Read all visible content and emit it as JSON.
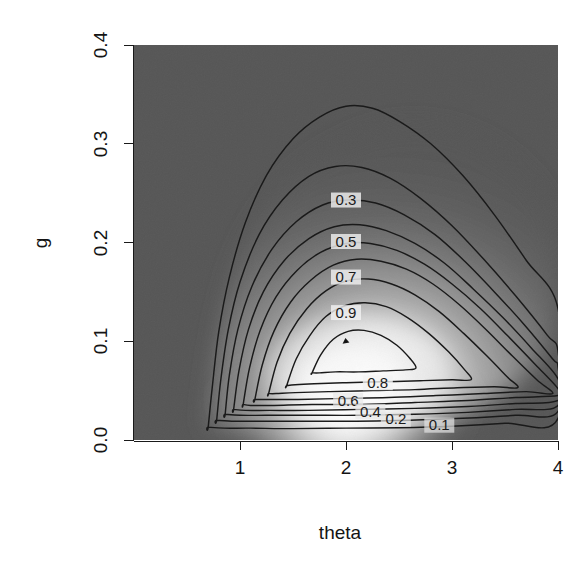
{
  "figure": {
    "kind": "contour-plot-with-grayscale-image",
    "background_color": "#ffffff",
    "panel_fill_color": "#565656",
    "contour_color": "#1a1a1a",
    "axis_color": "#141414"
  },
  "axes": {
    "x": {
      "title": "theta",
      "ticks": [
        {
          "label": "1",
          "value": 1
        },
        {
          "label": "2",
          "value": 2
        },
        {
          "label": "3",
          "value": 3
        },
        {
          "label": "4",
          "value": 4
        }
      ],
      "range": [
        0.0,
        4.0
      ]
    },
    "y": {
      "title": "g",
      "ticks": [
        {
          "label": "0.0",
          "value": 0.0
        },
        {
          "label": "0.1",
          "value": 0.1
        },
        {
          "label": "0.2",
          "value": 0.2
        },
        {
          "label": "0.3",
          "value": 0.3
        },
        {
          "label": "0.4",
          "value": 0.4
        }
      ],
      "range": [
        0.0,
        0.4
      ]
    }
  },
  "contour_labels": [
    {
      "text": "0.3",
      "x": 2.0,
      "y": 0.243
    },
    {
      "text": "0.5",
      "x": 2.0,
      "y": 0.201
    },
    {
      "text": "0.7",
      "x": 2.0,
      "y": 0.165
    },
    {
      "text": "0.9",
      "x": 2.0,
      "y": 0.129
    },
    {
      "text": "0.8",
      "x": 2.3,
      "y": 0.058
    },
    {
      "text": "0.6",
      "x": 2.02,
      "y": 0.04
    },
    {
      "text": "0.4",
      "x": 2.23,
      "y": 0.029
    },
    {
      "text": "0.2",
      "x": 2.47,
      "y": 0.021
    },
    {
      "text": "0.1",
      "x": 2.88,
      "y": 0.015
    }
  ],
  "peak_marker": {
    "x": 2.0,
    "y": 0.1,
    "label": "mode"
  },
  "chart_data": {
    "type": "contour",
    "title": "",
    "xlabel": "theta",
    "ylabel": "g",
    "xlim": [
      0.0,
      4.0
    ],
    "ylim": [
      0.0,
      0.4
    ],
    "grid": false,
    "legend": "none",
    "colormap": "grayscale (dark = low, white = high)",
    "levels": [
      0.1,
      0.2,
      0.3,
      0.4,
      0.5,
      0.6,
      0.7,
      0.8,
      0.9
    ],
    "labeled_levels": [
      "0.1",
      "0.2",
      "0.3",
      "0.4",
      "0.5",
      "0.6",
      "0.7",
      "0.8",
      "0.9"
    ],
    "z_range": [
      0.0,
      1.0
    ],
    "peak": {
      "x": 2.0,
      "y": 0.1,
      "z": 1.0
    },
    "contours": [
      {
        "level": 0.1,
        "points": [
          [
            0.7,
            0.013
          ],
          [
            0.74,
            0.055
          ],
          [
            0.8,
            0.11
          ],
          [
            0.9,
            0.165
          ],
          [
            1.05,
            0.22
          ],
          [
            1.25,
            0.268
          ],
          [
            1.5,
            0.305
          ],
          [
            1.75,
            0.327
          ],
          [
            2.0,
            0.338
          ],
          [
            2.25,
            0.336
          ],
          [
            2.5,
            0.323
          ],
          [
            2.8,
            0.3
          ],
          [
            3.1,
            0.268
          ],
          [
            3.4,
            0.228
          ],
          [
            3.7,
            0.182
          ],
          [
            4.0,
            0.133
          ],
          [
            4.0,
            0.022
          ],
          [
            3.5,
            0.017
          ],
          [
            3.0,
            0.014
          ],
          [
            2.5,
            0.0125
          ],
          [
            2.0,
            0.012
          ],
          [
            1.5,
            0.0115
          ],
          [
            1.1,
            0.012
          ],
          [
            0.85,
            0.012
          ],
          [
            0.7,
            0.013
          ]
        ]
      },
      {
        "level": 0.2,
        "points": [
          [
            0.78,
            0.02
          ],
          [
            0.82,
            0.062
          ],
          [
            0.89,
            0.112
          ],
          [
            1.0,
            0.16
          ],
          [
            1.18,
            0.208
          ],
          [
            1.4,
            0.243
          ],
          [
            1.65,
            0.267
          ],
          [
            1.9,
            0.277
          ],
          [
            2.15,
            0.276
          ],
          [
            2.42,
            0.265
          ],
          [
            2.7,
            0.245
          ],
          [
            3.0,
            0.217
          ],
          [
            3.3,
            0.183
          ],
          [
            3.6,
            0.146
          ],
          [
            3.9,
            0.106
          ],
          [
            4.0,
            0.09
          ],
          [
            4.0,
            0.029
          ],
          [
            3.6,
            0.025
          ],
          [
            3.1,
            0.022
          ],
          [
            2.6,
            0.02
          ],
          [
            2.1,
            0.019
          ],
          [
            1.6,
            0.019
          ],
          [
            1.2,
            0.019
          ],
          [
            0.95,
            0.019
          ],
          [
            0.78,
            0.02
          ]
        ]
      },
      {
        "level": 0.3,
        "points": [
          [
            0.86,
            0.026
          ],
          [
            0.9,
            0.066
          ],
          [
            0.98,
            0.112
          ],
          [
            1.11,
            0.155
          ],
          [
            1.3,
            0.193
          ],
          [
            1.53,
            0.221
          ],
          [
            1.78,
            0.238
          ],
          [
            2.02,
            0.243
          ],
          [
            2.28,
            0.24
          ],
          [
            2.55,
            0.228
          ],
          [
            2.84,
            0.208
          ],
          [
            3.12,
            0.181
          ],
          [
            3.4,
            0.15
          ],
          [
            3.68,
            0.117
          ],
          [
            3.95,
            0.082
          ],
          [
            4.0,
            0.074
          ],
          [
            4.0,
            0.035
          ],
          [
            3.6,
            0.031
          ],
          [
            3.15,
            0.028
          ],
          [
            2.65,
            0.026
          ],
          [
            2.15,
            0.025
          ],
          [
            1.65,
            0.025
          ],
          [
            1.25,
            0.025
          ],
          [
            1.0,
            0.025
          ],
          [
            0.86,
            0.026
          ]
        ]
      },
      {
        "level": 0.4,
        "points": [
          [
            0.94,
            0.031
          ],
          [
            0.99,
            0.07
          ],
          [
            1.08,
            0.112
          ],
          [
            1.22,
            0.15
          ],
          [
            1.42,
            0.182
          ],
          [
            1.65,
            0.204
          ],
          [
            1.89,
            0.216
          ],
          [
            2.13,
            0.218
          ],
          [
            2.38,
            0.212
          ],
          [
            2.65,
            0.199
          ],
          [
            2.93,
            0.179
          ],
          [
            3.2,
            0.153
          ],
          [
            3.48,
            0.124
          ],
          [
            3.75,
            0.093
          ],
          [
            4.0,
            0.062
          ],
          [
            4.0,
            0.04
          ],
          [
            3.6,
            0.037
          ],
          [
            3.15,
            0.034
          ],
          [
            2.65,
            0.032
          ],
          [
            2.15,
            0.031
          ],
          [
            1.65,
            0.03
          ],
          [
            1.28,
            0.03
          ],
          [
            1.05,
            0.03
          ],
          [
            0.94,
            0.031
          ]
        ]
      },
      {
        "level": 0.5,
        "points": [
          [
            1.03,
            0.036
          ],
          [
            1.09,
            0.073
          ],
          [
            1.19,
            0.111
          ],
          [
            1.34,
            0.145
          ],
          [
            1.54,
            0.172
          ],
          [
            1.76,
            0.19
          ],
          [
            2.0,
            0.199
          ],
          [
            2.23,
            0.199
          ],
          [
            2.48,
            0.192
          ],
          [
            2.74,
            0.178
          ],
          [
            3.0,
            0.158
          ],
          [
            3.27,
            0.133
          ],
          [
            3.53,
            0.105
          ],
          [
            3.79,
            0.076
          ],
          [
            4.0,
            0.052
          ],
          [
            4.0,
            0.045
          ],
          [
            3.6,
            0.043
          ],
          [
            3.15,
            0.04
          ],
          [
            2.65,
            0.038
          ],
          [
            2.15,
            0.036
          ],
          [
            1.68,
            0.036
          ],
          [
            1.32,
            0.035
          ],
          [
            1.1,
            0.035
          ],
          [
            1.03,
            0.036
          ]
        ]
      },
      {
        "level": 0.6,
        "points": [
          [
            1.14,
            0.041
          ],
          [
            1.21,
            0.076
          ],
          [
            1.32,
            0.11
          ],
          [
            1.48,
            0.14
          ],
          [
            1.67,
            0.162
          ],
          [
            1.88,
            0.177
          ],
          [
            2.1,
            0.183
          ],
          [
            2.33,
            0.181
          ],
          [
            2.57,
            0.173
          ],
          [
            2.82,
            0.158
          ],
          [
            3.07,
            0.137
          ],
          [
            3.32,
            0.112
          ],
          [
            3.57,
            0.085
          ],
          [
            3.8,
            0.061
          ],
          [
            3.95,
            0.047
          ],
          [
            3.7,
            0.049
          ],
          [
            3.3,
            0.047
          ],
          [
            2.85,
            0.045
          ],
          [
            2.4,
            0.043
          ],
          [
            1.95,
            0.042
          ],
          [
            1.55,
            0.041
          ],
          [
            1.28,
            0.041
          ],
          [
            1.14,
            0.041
          ]
        ]
      },
      {
        "level": 0.7,
        "points": [
          [
            1.27,
            0.047
          ],
          [
            1.35,
            0.079
          ],
          [
            1.47,
            0.108
          ],
          [
            1.63,
            0.133
          ],
          [
            1.81,
            0.151
          ],
          [
            2.0,
            0.161
          ],
          [
            2.21,
            0.163
          ],
          [
            2.43,
            0.158
          ],
          [
            2.65,
            0.147
          ],
          [
            2.88,
            0.13
          ],
          [
            3.11,
            0.108
          ],
          [
            3.33,
            0.085
          ],
          [
            3.52,
            0.064
          ],
          [
            3.62,
            0.053
          ],
          [
            3.4,
            0.054
          ],
          [
            3.05,
            0.053
          ],
          [
            2.65,
            0.051
          ],
          [
            2.25,
            0.05
          ],
          [
            1.85,
            0.049
          ],
          [
            1.52,
            0.048
          ],
          [
            1.34,
            0.047
          ],
          [
            1.27,
            0.047
          ]
        ]
      },
      {
        "level": 0.8,
        "points": [
          [
            1.44,
            0.055
          ],
          [
            1.53,
            0.082
          ],
          [
            1.66,
            0.106
          ],
          [
            1.81,
            0.125
          ],
          [
            1.99,
            0.136
          ],
          [
            2.18,
            0.139
          ],
          [
            2.38,
            0.135
          ],
          [
            2.58,
            0.124
          ],
          [
            2.78,
            0.108
          ],
          [
            2.97,
            0.089
          ],
          [
            3.12,
            0.071
          ],
          [
            3.18,
            0.061
          ],
          [
            3.0,
            0.061
          ],
          [
            2.7,
            0.06
          ],
          [
            2.35,
            0.059
          ],
          [
            2.0,
            0.058
          ],
          [
            1.7,
            0.057
          ],
          [
            1.52,
            0.056
          ],
          [
            1.44,
            0.055
          ]
        ]
      },
      {
        "level": 0.9,
        "points": [
          [
            1.68,
            0.068
          ],
          [
            1.76,
            0.086
          ],
          [
            1.88,
            0.102
          ],
          [
            2.02,
            0.11
          ],
          [
            2.17,
            0.111
          ],
          [
            2.33,
            0.106
          ],
          [
            2.48,
            0.096
          ],
          [
            2.6,
            0.083
          ],
          [
            2.66,
            0.073
          ],
          [
            2.56,
            0.071
          ],
          [
            2.35,
            0.07
          ],
          [
            2.12,
            0.069
          ],
          [
            1.9,
            0.069
          ],
          [
            1.75,
            0.068
          ],
          [
            1.68,
            0.068
          ]
        ]
      }
    ]
  }
}
